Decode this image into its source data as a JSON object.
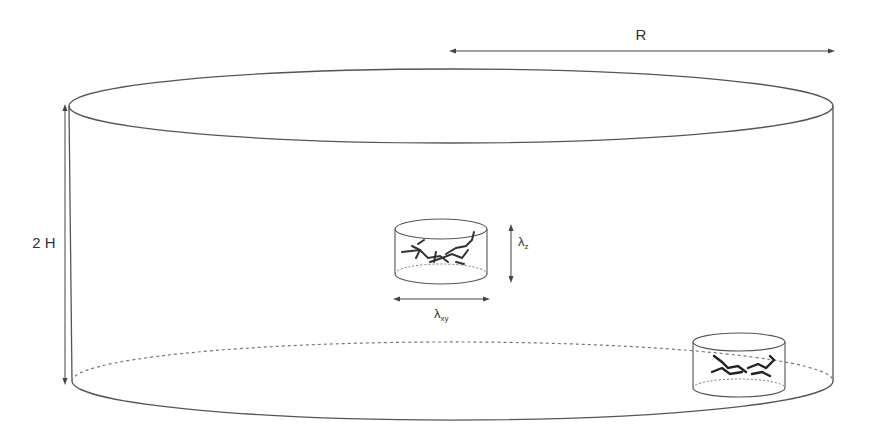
{
  "diagram": {
    "type": "cylindrical-simulation-box",
    "labels": {
      "radius": "R",
      "height": "2 H",
      "lambda_z_base": "λ",
      "lambda_z_sub": "z",
      "lambda_xy_base": "λ",
      "lambda_xy_sub": "xy"
    },
    "colors": {
      "line": "#555555",
      "dashed": "#777777",
      "text": "#333333",
      "molecule": "#333333"
    },
    "elements": [
      {
        "name": "outer-cylinder",
        "description": "Large cylinder of radius R and height 2H"
      },
      {
        "name": "inner-cylinder-center",
        "description": "Small cylinder containing a molecule, dimensions λxy by λz"
      },
      {
        "name": "inner-cylinder-bottom-right",
        "description": "Small cylinder containing a molecule near the bottom edge"
      }
    ]
  }
}
